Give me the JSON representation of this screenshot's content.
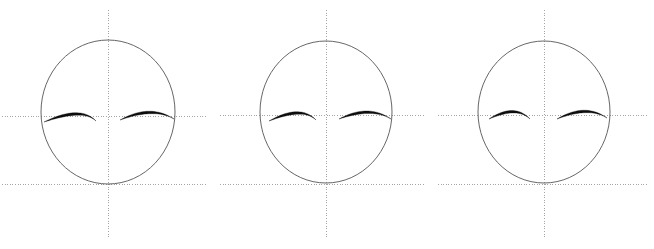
{
  "figure": {
    "title": "",
    "width": 654,
    "height": 249,
    "background": "#ffffff"
  },
  "style": {
    "outline_color": "#555555",
    "outline_width": 0.9,
    "axis_color": "#9a9a9a",
    "axis_width": 0.9,
    "axis_dash": "1,1.6",
    "brow_color": "#0d0d0d",
    "brow_width_max": 2.6
  },
  "panels": [
    {
      "name": "panel-1",
      "label": "",
      "ellipse": {
        "cx": 108,
        "cy": 112,
        "rx": 67,
        "ry": 72
      },
      "vertical_axis": {
        "x": 108,
        "y1": 10,
        "y2": 237
      },
      "horizontal_axis_upper": {
        "y": 116,
        "x1": 2,
        "x2": 207
      },
      "horizontal_axis_lower": {
        "y": 184,
        "x1": 2,
        "x2": 207
      },
      "brow_left": {
        "name": "eyebrow-left",
        "start": [
          44,
          122
        ],
        "control": [
          80,
          104
        ],
        "end": [
          96,
          121
        ],
        "thickness": 2.6
      },
      "brow_right": {
        "name": "eyebrow-right",
        "start": [
          120,
          120
        ],
        "control": [
          150,
          103
        ],
        "end": [
          174,
          119
        ],
        "thickness": 2.6
      }
    },
    {
      "name": "panel-2",
      "label": "",
      "ellipse": {
        "cx": 326,
        "cy": 112,
        "rx": 66,
        "ry": 71
      },
      "vertical_axis": {
        "x": 326,
        "y1": 10,
        "y2": 237
      },
      "horizontal_axis_upper": {
        "y": 115,
        "x1": 220,
        "x2": 425
      },
      "horizontal_axis_lower": {
        "y": 184,
        "x1": 220,
        "x2": 425
      },
      "brow_left": {
        "name": "eyebrow-left",
        "start": [
          269,
          121
        ],
        "control": [
          300,
          103
        ],
        "end": [
          316,
          120
        ],
        "thickness": 2.6
      },
      "brow_right": {
        "name": "eyebrow-right",
        "start": [
          339,
          119
        ],
        "control": [
          368,
          103
        ],
        "end": [
          391,
          119
        ],
        "thickness": 2.6
      }
    },
    {
      "name": "panel-3",
      "label": "",
      "ellipse": {
        "cx": 544,
        "cy": 112,
        "rx": 66,
        "ry": 71
      },
      "vertical_axis": {
        "x": 544,
        "y1": 10,
        "y2": 237
      },
      "horizontal_axis_upper": {
        "y": 115,
        "x1": 438,
        "x2": 648
      },
      "horizontal_axis_lower": {
        "y": 184,
        "x1": 438,
        "x2": 648
      },
      "brow_left": {
        "name": "eyebrow-left",
        "start": [
          489,
          119
        ],
        "control": [
          514,
          102
        ],
        "end": [
          530,
          119
        ],
        "thickness": 2.6
      },
      "brow_right": {
        "name": "eyebrow-right",
        "start": [
          557,
          119
        ],
        "control": [
          585,
          102
        ],
        "end": [
          607,
          118
        ],
        "thickness": 2.6
      }
    }
  ]
}
